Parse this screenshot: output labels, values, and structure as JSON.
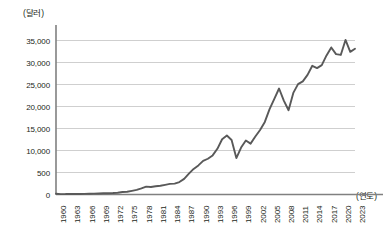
{
  "chart_data": {
    "type": "line",
    "title": "",
    "subtitle": "",
    "xlabel": "(연도)",
    "ylabel": "(달러)",
    "ylim": [
      0,
      37000
    ],
    "xlim": [
      1960,
      2023
    ],
    "grid": true,
    "legend": false,
    "legend_position": "none",
    "line_color": "#595959",
    "axis_color": "#808080",
    "grid_color": "#c9c9c9",
    "y_ticks": [
      {
        "value": 0,
        "label": "0"
      },
      {
        "value": 5000,
        "label": "500"
      },
      {
        "value": 10000,
        "label": "10,000"
      },
      {
        "value": 15000,
        "label": "15,000"
      },
      {
        "value": 20000,
        "label": "20,000"
      },
      {
        "value": 25000,
        "label": "25,000"
      },
      {
        "value": 30000,
        "label": "30,000"
      },
      {
        "value": 35000,
        "label": "35,000"
      }
    ],
    "x_ticks": [
      "1960",
      "1963",
      "1966",
      "1969",
      "1972",
      "1975",
      "1978",
      "1981",
      "1984",
      "1987",
      "1990",
      "1993",
      "1996",
      "1999",
      "2002",
      "2005",
      "2008",
      "2011",
      "2014",
      "2017",
      "2020",
      "2023"
    ],
    "x": [
      1960,
      1961,
      1962,
      1963,
      1964,
      1965,
      1966,
      1967,
      1968,
      1969,
      1970,
      1971,
      1972,
      1973,
      1974,
      1975,
      1976,
      1977,
      1978,
      1979,
      1980,
      1981,
      1982,
      1983,
      1984,
      1985,
      1986,
      1987,
      1988,
      1989,
      1990,
      1991,
      1992,
      1993,
      1994,
      1995,
      1996,
      1997,
      1998,
      1999,
      2000,
      2001,
      2002,
      2003,
      2004,
      2005,
      2006,
      2007,
      2008,
      2009,
      2010,
      2011,
      2012,
      2013,
      2014,
      2015,
      2016,
      2017,
      2018,
      2019,
      2020,
      2021,
      2022,
      2023
    ],
    "values": [
      158,
      94,
      106,
      146,
      124,
      110,
      133,
      161,
      198,
      243,
      279,
      301,
      324,
      406,
      563,
      617,
      834,
      150,
      1400,
      1784,
      1715,
      1883,
      1983,
      2199,
      2413,
      2482,
      2835,
      3555,
      4749,
      5817,
      6610,
      7637,
      8127,
      8883,
      10385,
      12565,
      13403,
      12398,
      8282,
      10672,
      12257,
      11561,
      13165,
      14673,
      16496,
      19403,
      21743,
      24086,
      21350,
      19152,
      23087,
      25096,
      25724,
      27183,
      29250,
      28732,
      29394,
      31617,
      33422,
      31902,
      31721,
      35126,
      32418,
      33121
    ],
    "series": [
      {
        "name": "1인당 국민총소득",
        "values": [
          158,
          94,
          106,
          146,
          124,
          110,
          133,
          161,
          198,
          243,
          279,
          301,
          324,
          406,
          563,
          617,
          834,
          1050,
          1400,
          1784,
          1715,
          1883,
          1983,
          2199,
          2413,
          2482,
          2835,
          3555,
          4749,
          5817,
          6610,
          7637,
          8127,
          8883,
          10385,
          12565,
          13403,
          12398,
          8282,
          10672,
          12257,
          11561,
          13165,
          14673,
          16496,
          19403,
          21743,
          24086,
          21350,
          19152,
          23087,
          25096,
          25724,
          27183,
          29250,
          28732,
          29394,
          31617,
          33422,
          31902,
          31721,
          35126,
          32418,
          33121
        ]
      }
    ],
    "annotations": []
  }
}
